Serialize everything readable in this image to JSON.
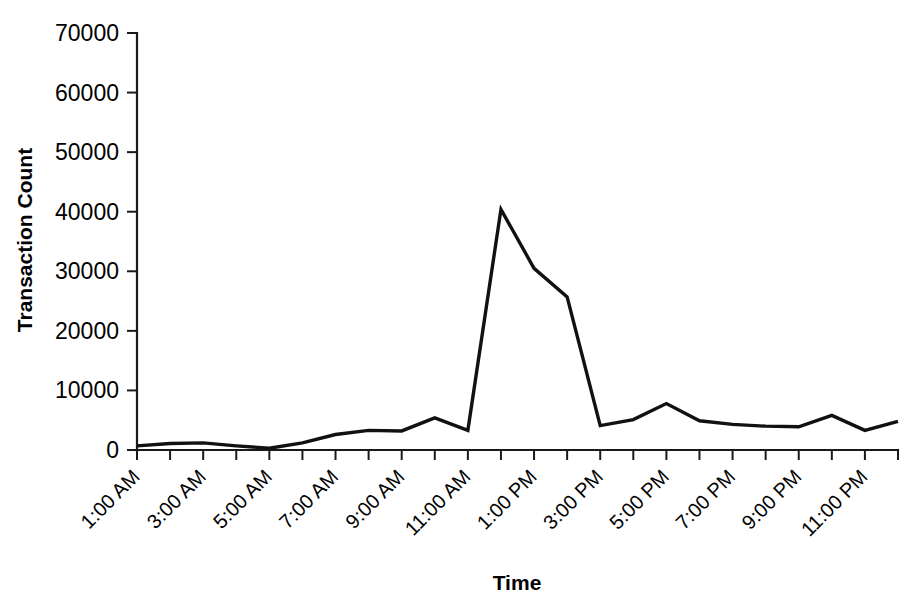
{
  "chart_data": {
    "type": "line",
    "title": "",
    "xlabel": "Time",
    "ylabel": "Transaction Count",
    "ylim": [
      0,
      70000
    ],
    "ytick_labels": [
      "0",
      "10000",
      "20000",
      "30000",
      "40000",
      "50000",
      "60000",
      "70000"
    ],
    "ytick_values": [
      0,
      10000,
      20000,
      30000,
      40000,
      50000,
      60000,
      70000
    ],
    "grid": false,
    "legend": false,
    "legend_position": "none",
    "x": [
      "1:00 AM",
      "2:00 AM",
      "3:00 AM",
      "4:00 AM",
      "5:00 AM",
      "6:00 AM",
      "7:00 AM",
      "8:00 AM",
      "9:00 AM",
      "10:00 AM",
      "11:00 AM",
      "12:00 PM",
      "1:00 PM",
      "2:00 PM",
      "3:00 PM",
      "4:00 PM",
      "5:00 PM",
      "6:00 PM",
      "7:00 PM",
      "8:00 PM",
      "9:00 PM",
      "10:00 PM",
      "11:00 PM",
      "12:00 AM"
    ],
    "xtick_labels": [
      "1:00 AM",
      "3:00 AM",
      "5:00 AM",
      "7:00 AM",
      "9:00 AM",
      "11:00 AM",
      "1:00 PM",
      "3:00 PM",
      "5:00 PM",
      "7:00 PM",
      "9:00 PM",
      "11:00 PM"
    ],
    "xtick_label_rotation": 45,
    "values": [
      700,
      1100,
      1200,
      700,
      300,
      1200,
      2600,
      3300,
      3200,
      5400,
      3300,
      40400,
      30500,
      25700,
      4100,
      5100,
      7800,
      4900,
      4300,
      4000,
      3900,
      5800,
      3300,
      4800
    ],
    "series_name": "Transaction Count",
    "line_color": "#111111",
    "peak": {
      "label": "11:00 AM",
      "value": 40400
    },
    "minimum": {
      "label": "5:00 AM",
      "value": 300
    }
  }
}
